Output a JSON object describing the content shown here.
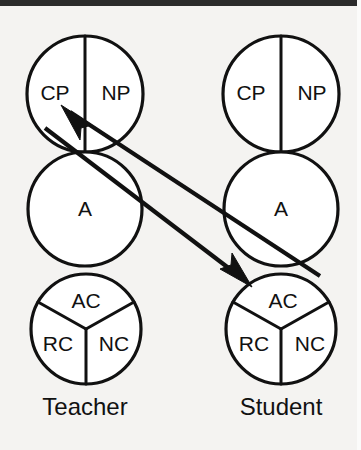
{
  "figure": {
    "kind": "transactional-analysis-ego-state-diagram",
    "background_color": "#f4f3f1",
    "ink_color": "#111111",
    "border_color": "#2b2b2b"
  },
  "columns": [
    {
      "id": "teacher",
      "person_label": "Teacher",
      "person_label_x": 85,
      "person_label_y": 409,
      "center_x": 85,
      "parent": {
        "name": "parent-circle",
        "cx": 85,
        "cy": 94,
        "r": 58,
        "segments": [
          {
            "id": "cp",
            "label": "CP",
            "x": 55,
            "y": 94
          },
          {
            "id": "np",
            "label": "NP",
            "x": 116,
            "y": 94
          }
        ]
      },
      "adult": {
        "name": "adult-circle",
        "cx": 85,
        "cy": 209,
        "r": 57,
        "segments": [
          {
            "id": "a",
            "label": "A",
            "x": 85,
            "y": 210
          }
        ]
      },
      "child": {
        "name": "child-circle",
        "cx": 86,
        "cy": 329,
        "r": 55,
        "segments": [
          {
            "id": "ac",
            "label": "AC",
            "x": 86,
            "y": 302
          },
          {
            "id": "rc",
            "label": "RC",
            "x": 58,
            "y": 345
          },
          {
            "id": "nc",
            "label": "NC",
            "x": 114,
            "y": 345
          }
        ]
      }
    },
    {
      "id": "student",
      "person_label": "Student",
      "person_label_x": 281,
      "person_label_y": 409,
      "center_x": 281,
      "parent": {
        "name": "parent-circle",
        "cx": 281,
        "cy": 94,
        "r": 58,
        "segments": [
          {
            "id": "cp",
            "label": "CP",
            "x": 251,
            "y": 94
          },
          {
            "id": "np",
            "label": "NP",
            "x": 312,
            "y": 94
          }
        ]
      },
      "adult": {
        "name": "adult-circle",
        "cx": 281,
        "cy": 209,
        "r": 57,
        "segments": [
          {
            "id": "a",
            "label": "A",
            "x": 281,
            "y": 210
          }
        ]
      },
      "child": {
        "name": "child-circle",
        "cx": 281,
        "cy": 329,
        "r": 55,
        "segments": [
          {
            "id": "ac",
            "label": "AC",
            "x": 283,
            "y": 302
          },
          {
            "id": "rc",
            "label": "RC",
            "x": 254,
            "y": 345
          },
          {
            "id": "nc",
            "label": "NC",
            "x": 310,
            "y": 345
          }
        ]
      }
    }
  ],
  "transactions": [
    {
      "id": "student-ac-to-teacher-cp",
      "name": "response-vector",
      "from": "Student AC",
      "to": "Teacher CP",
      "x1": 320,
      "y1": 276,
      "x2": 62,
      "y2": 107,
      "head_at": "end",
      "head_points": "62,106 89,126 80,129 79,137"
    },
    {
      "id": "teacher-cp-to-student-ac",
      "name": "stimulus-vector",
      "from": "Teacher CP",
      "to": "Student AC",
      "x1": 45,
      "y1": 128,
      "x2": 249,
      "y2": 284,
      "head_at": "end",
      "head_points": "250,285 222,270 231,266 231,258"
    }
  ]
}
